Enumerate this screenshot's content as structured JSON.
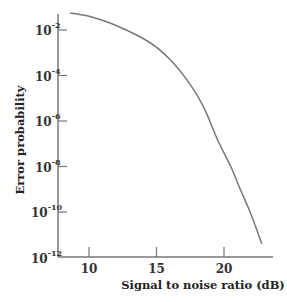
{
  "chart_data": {
    "type": "line",
    "title": "",
    "xlabel": "Signal to noise ratio (dB)",
    "ylabel": "Error probability",
    "xscale": "linear",
    "yscale": "log",
    "xlim": [
      7.7,
      24.2
    ],
    "ylim": [
      1e-12,
      0.06
    ],
    "x_ticks": [
      10,
      15,
      20
    ],
    "x_tick_labels": [
      "10",
      "15",
      "20"
    ],
    "y_ticks": [
      0.01,
      0.0001,
      1e-06,
      1e-08,
      1e-10,
      1e-12
    ],
    "y_tick_labels": [
      {
        "base": "10",
        "exp": "-2"
      },
      {
        "base": "10",
        "exp": "-4"
      },
      {
        "base": "10",
        "exp": "-6"
      },
      {
        "base": "10",
        "exp": "-8"
      },
      {
        "base": "10",
        "exp": "-10"
      },
      {
        "base": "10",
        "exp": "-12"
      }
    ],
    "grid": false,
    "legend": null,
    "series": [
      {
        "name": "Error probability",
        "color": "#777777",
        "x": [
          8.6,
          10.0,
          12.0,
          14.5,
          16.0,
          17.5,
          18.5,
          19.5,
          20.5,
          21.2,
          22.0,
          22.8
        ],
        "log10_y": [
          -1.25,
          -1.4,
          -1.8,
          -2.55,
          -3.3,
          -4.4,
          -5.4,
          -6.8,
          -8.0,
          -9.0,
          -10.1,
          -11.4
        ]
      }
    ]
  }
}
